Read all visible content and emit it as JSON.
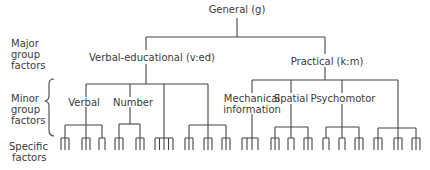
{
  "diagram": {
    "title": "General (g)",
    "row_labels": {
      "major": "Major\ngroup\nfactors",
      "minor": "Minor\ngroup\nfactors",
      "specific": "Specific\nfactors"
    },
    "major_groups": [
      {
        "label": "Verbal-educational (v:ed)",
        "minor_groups": [
          {
            "label": "Verbal",
            "specific_combs": [
              3,
              3,
              2
            ]
          },
          {
            "label": "Number",
            "specific_combs": [
              3,
              3
            ]
          },
          {
            "label": "",
            "specific_combs": [
              5
            ]
          },
          {
            "label": "",
            "specific_combs": [
              3,
              3,
              3
            ]
          }
        ]
      },
      {
        "label": "Practical (k:m)",
        "minor_groups": [
          {
            "label": "Mechanical information",
            "specific_combs": [
              4
            ]
          },
          {
            "label": "Spatial",
            "specific_combs": [
              3,
              2,
              3
            ]
          },
          {
            "label": "Psychomotor",
            "specific_combs": [
              2,
              2,
              3
            ]
          },
          {
            "label": "",
            "specific_combs": [
              3,
              3,
              3
            ]
          }
        ]
      }
    ]
  },
  "labels": {
    "general": "General (g)",
    "verbal_educational": "Verbal-educational (v:ed)",
    "practical": "Practical (k:m)",
    "verbal": "Verbal",
    "number": "Number",
    "mechanical_line1": "Mechanical",
    "mechanical_line2": "information",
    "spatial": "Spatial",
    "psychomotor": "Psychomotor",
    "major_1": "Major",
    "major_2": "group",
    "major_3": "factors",
    "minor_1": "Minor",
    "minor_2": "group",
    "minor_3": "factors",
    "specific_1": "Specific",
    "specific_2": "factors"
  }
}
